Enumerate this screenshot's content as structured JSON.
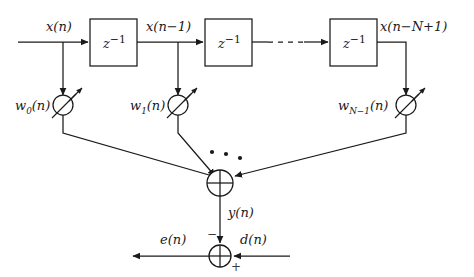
{
  "diagram": {
    "stroke_color": "#1a1a1a",
    "background_color": "#ffffff",
    "signals": {
      "input": "x(n)",
      "tap1": "x(n−1)",
      "tapN": "x(n−N+1)",
      "filter_output": "y(n)",
      "desired": "d(n)",
      "error": "e(n)"
    },
    "delay_blocks": [
      {
        "label_base": "z",
        "label_exp": "−1"
      },
      {
        "label_base": "z",
        "label_exp": "−1"
      },
      {
        "label_base": "z",
        "label_exp": "−1"
      }
    ],
    "weights": [
      {
        "base": "w",
        "sub": "0",
        "arg": "(n)"
      },
      {
        "base": "w",
        "sub": "1",
        "arg": "(n)"
      },
      {
        "base": "w",
        "sub": "N−1",
        "arg": "(n)"
      }
    ],
    "summer_signs": {
      "minus": "−",
      "plus": "+"
    },
    "ellipsis_dots": 3
  }
}
